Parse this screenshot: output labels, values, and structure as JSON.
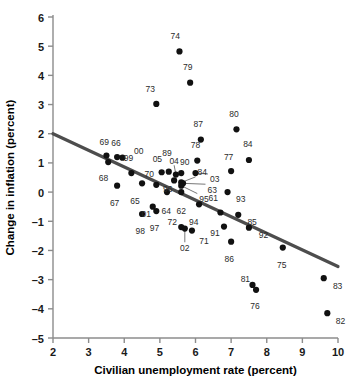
{
  "chart_data": {
    "type": "scatter",
    "title": "",
    "xlabel": "Civilian unemployment rate (percent)",
    "ylabel": "Change in inflation (percent)",
    "xlim": [
      2,
      10
    ],
    "ylim": [
      -5,
      6
    ],
    "xticks": [
      "2",
      "3",
      "4",
      "5",
      "6",
      "7",
      "8",
      "9",
      "10"
    ],
    "yticks": [
      "6",
      "5",
      "4",
      "3",
      "2",
      "1",
      "0",
      "-1",
      "-2",
      "-3",
      "-4",
      "-5"
    ],
    "grid": false,
    "legend": null,
    "marker_color": "#111111",
    "trendline_color": "#4d4d4d",
    "axis_color": "#8c8c8c",
    "trendline": {
      "label": "fitted Phillips curve",
      "x_start": 2,
      "y_start": 2.0,
      "x_end": 10,
      "y_end": -2.55
    },
    "points": [
      {
        "label": "61",
        "x": 6.7,
        "y": -0.7,
        "lx": 6.5,
        "ly": -0.35,
        "anchor": "middle",
        "leader": false
      },
      {
        "label": "62",
        "x": 5.6,
        "y": 0.0,
        "lx": 5.6,
        "ly": -0.45,
        "anchor": "middle",
        "leader": false
      },
      {
        "label": "63",
        "x": 5.65,
        "y": 0.3,
        "lx": 6.28,
        "ly": 0.27,
        "anchor": "start",
        "leader": true
      },
      {
        "label": "64",
        "x": 5.2,
        "y": 0.0,
        "lx": 5.18,
        "ly": -0.45,
        "anchor": "middle",
        "leader": false
      },
      {
        "label": "65",
        "x": 4.5,
        "y": 0.3,
        "lx": 4.3,
        "ly": -0.1,
        "anchor": "middle",
        "leader": false
      },
      {
        "label": "66",
        "x": 3.8,
        "y": 1.2,
        "lx": 3.77,
        "ly": 1.52,
        "anchor": "middle",
        "leader": false
      },
      {
        "label": "67",
        "x": 3.8,
        "y": 0.22,
        "lx": 3.73,
        "ly": -0.18,
        "anchor": "middle",
        "leader": false
      },
      {
        "label": "68",
        "x": 3.55,
        "y": 1.03,
        "lx": 3.42,
        "ly": 0.68,
        "anchor": "middle",
        "leader": false
      },
      {
        "label": "69",
        "x": 3.5,
        "y": 1.25,
        "lx": 3.44,
        "ly": 1.55,
        "anchor": "middle",
        "leader": false
      },
      {
        "label": "70",
        "x": 4.9,
        "y": 0.25,
        "lx": 4.7,
        "ly": 0.48,
        "anchor": "middle",
        "leader": false
      },
      {
        "label": "71",
        "x": 5.9,
        "y": -1.32,
        "lx": 6.05,
        "ly": -1.48,
        "anchor": "start",
        "leader": false
      },
      {
        "label": "72",
        "x": 5.6,
        "y": -1.2,
        "lx": 5.35,
        "ly": -1.18,
        "anchor": "middle",
        "leader": false
      },
      {
        "label": "73",
        "x": 4.9,
        "y": 3.02,
        "lx": 4.73,
        "ly": 3.38,
        "anchor": "middle",
        "leader": false
      },
      {
        "label": "74",
        "x": 5.55,
        "y": 4.82,
        "lx": 5.43,
        "ly": 5.18,
        "anchor": "middle",
        "leader": false
      },
      {
        "label": "75",
        "x": 8.45,
        "y": -1.9,
        "lx": 8.42,
        "ly": -2.3,
        "anchor": "middle",
        "leader": false
      },
      {
        "label": "76",
        "x": 7.7,
        "y": -3.35,
        "lx": 7.67,
        "ly": -3.72,
        "anchor": "middle",
        "leader": false
      },
      {
        "label": "77",
        "x": 7.0,
        "y": 0.72,
        "lx": 6.93,
        "ly": 1.05,
        "anchor": "middle",
        "leader": false
      },
      {
        "label": "78",
        "x": 6.05,
        "y": 1.08,
        "lx": 6.0,
        "ly": 1.45,
        "anchor": "middle",
        "leader": false
      },
      {
        "label": "79",
        "x": 5.85,
        "y": 3.75,
        "lx": 5.78,
        "ly": 4.12,
        "anchor": "middle",
        "leader": false
      },
      {
        "label": "80",
        "x": 7.15,
        "y": 2.15,
        "lx": 7.08,
        "ly": 2.52,
        "anchor": "middle",
        "leader": false
      },
      {
        "label": "81",
        "x": 7.6,
        "y": -3.18,
        "lx": 7.4,
        "ly": -3.12,
        "anchor": "middle",
        "leader": false
      },
      {
        "label": "82",
        "x": 9.7,
        "y": -4.15,
        "lx": 9.88,
        "ly": -4.22,
        "anchor": "start",
        "leader": false
      },
      {
        "label": "83",
        "x": 9.6,
        "y": -2.95,
        "lx": 9.8,
        "ly": -3.02,
        "anchor": "start",
        "leader": false
      },
      {
        "label": "84",
        "x": 7.5,
        "y": 1.1,
        "lx": 7.47,
        "ly": 1.48,
        "anchor": "middle",
        "leader": false
      },
      {
        "label": "84",
        "x": 5.6,
        "y": 0.33,
        "lx": 6.0,
        "ly": 0.52,
        "anchor": "start",
        "leader": true
      },
      {
        "label": "85",
        "x": 7.2,
        "y": -0.78,
        "lx": 7.4,
        "ly": -0.82,
        "anchor": "start",
        "leader": false
      },
      {
        "label": "86",
        "x": 7.0,
        "y": -1.7,
        "lx": 6.95,
        "ly": -2.1,
        "anchor": "middle",
        "leader": false
      },
      {
        "label": "87",
        "x": 6.15,
        "y": 1.8,
        "lx": 6.08,
        "ly": 2.17,
        "anchor": "middle",
        "leader": false
      },
      {
        "label": "89",
        "x": 5.25,
        "y": 0.7,
        "lx": 5.2,
        "ly": 1.18,
        "anchor": "middle",
        "leader": false
      },
      {
        "label": "90",
        "x": 5.6,
        "y": 0.65,
        "lx": 5.7,
        "ly": 0.88,
        "anchor": "middle",
        "leader": false
      },
      {
        "label": "91",
        "x": 6.8,
        "y": -1.18,
        "lx": 6.55,
        "ly": -1.22,
        "anchor": "middle",
        "leader": false
      },
      {
        "label": "92",
        "x": 7.5,
        "y": -1.22,
        "lx": 7.72,
        "ly": -1.28,
        "anchor": "start",
        "leader": false
      },
      {
        "label": "93",
        "x": 6.9,
        "y": 0.0,
        "lx": 7.08,
        "ly": -0.05,
        "anchor": "start",
        "leader": false
      },
      {
        "label": "94",
        "x": 6.1,
        "y": -0.42,
        "lx": 5.95,
        "ly": -0.82,
        "anchor": "middle",
        "leader": false
      },
      {
        "label": "95",
        "x": 5.6,
        "y": 0.22,
        "lx": 6.05,
        "ly": -0.05,
        "anchor": "start",
        "leader": true
      },
      {
        "label": "96",
        "x": 5.4,
        "y": 0.4,
        "lx": 5.22,
        "ly": 0.3,
        "anchor": "middle",
        "leader": false
      },
      {
        "label": "97",
        "x": 4.9,
        "y": -0.65,
        "lx": 4.85,
        "ly": -1.05,
        "anchor": "middle",
        "leader": false
      },
      {
        "label": "98",
        "x": 4.5,
        "y": -0.75,
        "lx": 4.45,
        "ly": -1.15,
        "anchor": "middle",
        "leader": false
      },
      {
        "label": "99",
        "x": 4.2,
        "y": 0.65,
        "lx": 4.12,
        "ly": 1.02,
        "anchor": "middle",
        "leader": false
      },
      {
        "label": "00",
        "x": 3.95,
        "y": 1.18,
        "lx": 4.22,
        "ly": 1.25,
        "anchor": "start",
        "leader": false
      },
      {
        "label": "01",
        "x": 4.8,
        "y": -0.5,
        "lx": 4.62,
        "ly": -0.55,
        "anchor": "middle",
        "leader": false
      },
      {
        "label": "02",
        "x": 5.7,
        "y": -1.25,
        "lx": 5.7,
        "ly": -1.72,
        "anchor": "middle",
        "leader": true
      },
      {
        "label": "03",
        "x": 6.0,
        "y": 0.65,
        "lx": 6.35,
        "ly": 0.62,
        "anchor": "start",
        "leader": true
      },
      {
        "label": "04",
        "x": 5.45,
        "y": 0.6,
        "lx": 5.4,
        "ly": 0.92,
        "anchor": "middle",
        "leader": true
      },
      {
        "label": "05",
        "x": 5.05,
        "y": 0.68,
        "lx": 4.93,
        "ly": 0.98,
        "anchor": "middle",
        "leader": false
      }
    ]
  }
}
